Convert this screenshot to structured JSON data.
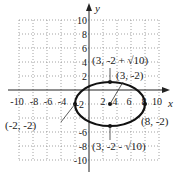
{
  "graph": {
    "axes": {
      "x_label": "x",
      "y_label": "y"
    },
    "x_ticks": [
      "-10",
      "-8",
      "-6",
      "-4",
      "2",
      "4",
      "6",
      "8",
      "10"
    ],
    "y_ticks": [
      "10",
      "8",
      "6",
      "4",
      "2",
      "-2",
      "-6",
      "-8",
      "-10"
    ],
    "ellipse": {
      "center": [
        3,
        -2
      ],
      "rx": 5,
      "ry": 3.162
    },
    "points": [
      {
        "label": "(3, -2 + √10)",
        "x": 3,
        "y": 1.162
      },
      {
        "label": "(3, -2)",
        "x": 3,
        "y": -2
      },
      {
        "label": "(-2, -2)",
        "x": -2,
        "y": -2
      },
      {
        "label": "(8, -2)",
        "x": 8,
        "y": -2
      },
      {
        "label": "(3, -2 - √10)",
        "x": 3,
        "y": -5.162
      }
    ],
    "colors": {
      "curve": "#111111",
      "grid": "#888888",
      "axis": "#222222"
    }
  }
}
